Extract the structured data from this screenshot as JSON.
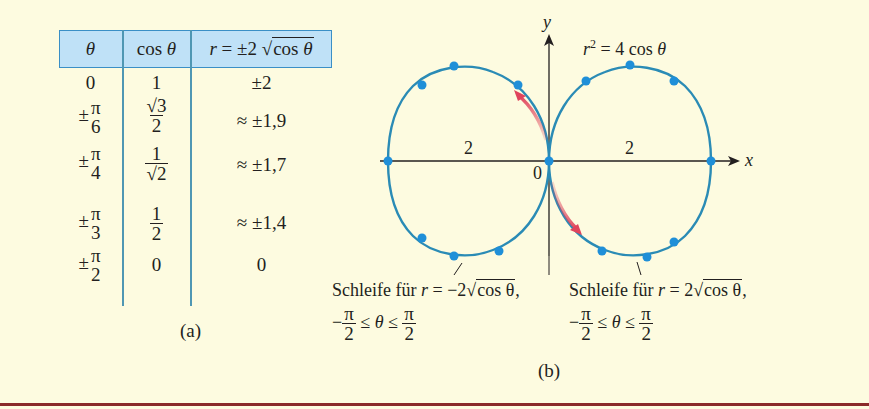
{
  "table": {
    "headers": [
      "θ",
      "cos θ",
      "r = ±2 √cos θ"
    ],
    "header_parts": {
      "theta": "θ",
      "cos": "cos ",
      "cos_theta": "θ",
      "r": "r",
      "eq": " = ±2 ",
      "rad_cos": "cos ",
      "rad_theta": "θ"
    },
    "rows": [
      {
        "theta": {
          "sign": "",
          "num": "",
          "den": "",
          "plain": "0"
        },
        "cos": {
          "plain": "1"
        },
        "r": "±2"
      },
      {
        "theta": {
          "sign": "±",
          "num": "π",
          "den": "6"
        },
        "cos": {
          "num": "√3",
          "den": "2"
        },
        "r": "≈  ±1,9"
      },
      {
        "theta": {
          "sign": "±",
          "num": "π",
          "den": "4"
        },
        "cos": {
          "num": "1",
          "den": "√2"
        },
        "r": "≈  ±1,7"
      },
      {
        "theta": {
          "sign": "±",
          "num": "π",
          "den": "3"
        },
        "cos": {
          "num": "1",
          "den": "2"
        },
        "r": "≈  ±1,4"
      },
      {
        "theta": {
          "sign": "±",
          "num": "π",
          "den": "2"
        },
        "cos": {
          "plain": "0"
        },
        "r": "0"
      }
    ],
    "caption": "(a)"
  },
  "graph": {
    "equation_r": "r",
    "equation_sup": "2",
    "equation_rest": " = 4 cos ",
    "equation_theta": "θ",
    "x_axis_label": "x",
    "y_axis_label": "y",
    "origin_label": "0",
    "left_tick_label": "2",
    "right_tick_label": "2",
    "caption": "(b)",
    "left_loop_label": {
      "prefix": "Schleife für ",
      "r": "r",
      "eq": " = −2",
      "rad": "cos θ",
      "suffix": ",",
      "range_left": "−",
      "range_mid": " ≤ θ ≤ ",
      "pi": "π",
      "two": "2"
    },
    "right_loop_label": {
      "prefix": "Schleife für ",
      "r": "r",
      "eq": " = 2",
      "rad": "cos θ",
      "suffix": ",",
      "range_left": "−",
      "range_mid": " ≤ θ ≤ ",
      "pi": "π",
      "two": "2"
    },
    "colors": {
      "curve": "#2a8bb5",
      "dot": "#1f8fd8",
      "arrow": "#e0445c",
      "axis": "#231f20"
    }
  },
  "colors": {
    "background": "#fdfbe0",
    "header_fill": "#bfe1f7",
    "header_border": "#3a8fc6",
    "bottom_rule": "#8b2a2a"
  }
}
